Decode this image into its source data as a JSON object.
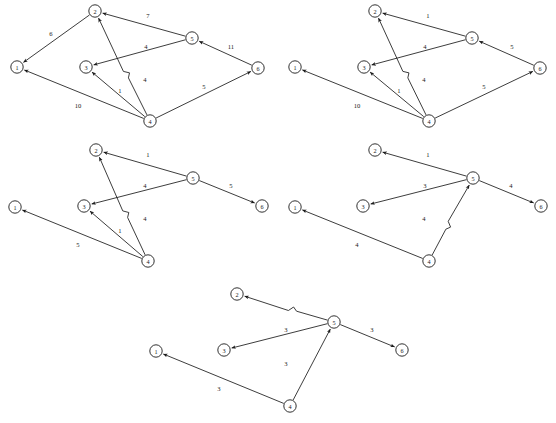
{
  "figure": {
    "title": "",
    "panel_count": 5,
    "node_labels": [
      "1",
      "2",
      "3",
      "4",
      "5",
      "6"
    ],
    "panels": [
      {
        "name": "panel-1",
        "origin": {
          "x": 0,
          "y": 0
        },
        "nodes": [
          {
            "id": "1",
            "label": "1",
            "x": 17,
            "y": 67
          },
          {
            "id": "2",
            "label": "2",
            "x": 95,
            "y": 11
          },
          {
            "id": "3",
            "label": "3",
            "x": 86,
            "y": 67
          },
          {
            "id": "4",
            "label": "4",
            "x": 150,
            "y": 121
          },
          {
            "id": "5",
            "label": "5",
            "x": 192,
            "y": 38
          },
          {
            "id": "6",
            "label": "6",
            "x": 258,
            "y": 68
          }
        ],
        "edges": [
          {
            "from": "2",
            "to": "1",
            "weight": "6",
            "label_x": 51,
            "label_y": 33
          },
          {
            "from": "5",
            "to": "2",
            "weight": "7",
            "label_x": 148,
            "label_y": 15
          },
          {
            "from": "5",
            "to": "3",
            "weight": "4",
            "label_x": 146,
            "label_y": 46
          },
          {
            "from": "4",
            "to": "2",
            "weight": "4",
            "label_x": 145,
            "label_y": 79,
            "hop": true
          },
          {
            "from": "4",
            "to": "3",
            "weight": "1",
            "label_x": 120,
            "label_y": 90
          },
          {
            "from": "4",
            "to": "1",
            "weight": "10",
            "label_x": 78,
            "label_y": 105
          },
          {
            "from": "6",
            "to": "5",
            "weight": "11",
            "label_x": 231,
            "label_y": 46
          },
          {
            "from": "4",
            "to": "6",
            "weight": "5",
            "label_x": 204,
            "label_y": 86
          }
        ]
      },
      {
        "name": "panel-2",
        "origin": {
          "x": 278,
          "y": 0
        },
        "nodes": [
          {
            "id": "1",
            "label": "1",
            "x": 295,
            "y": 67
          },
          {
            "id": "2",
            "label": "2",
            "x": 375,
            "y": 11
          },
          {
            "id": "3",
            "label": "3",
            "x": 364,
            "y": 67
          },
          {
            "id": "4",
            "label": "4",
            "x": 429,
            "y": 121
          },
          {
            "id": "5",
            "label": "5",
            "x": 472,
            "y": 38
          },
          {
            "id": "6",
            "label": "6",
            "x": 540,
            "y": 68
          }
        ],
        "edges": [
          {
            "from": "5",
            "to": "2",
            "weight": "1",
            "label_x": 428,
            "label_y": 15
          },
          {
            "from": "5",
            "to": "3",
            "weight": "4",
            "label_x": 425,
            "label_y": 46
          },
          {
            "from": "4",
            "to": "2",
            "weight": "4",
            "label_x": 424,
            "label_y": 79,
            "hop": true
          },
          {
            "from": "4",
            "to": "3",
            "weight": "1",
            "label_x": 399,
            "label_y": 90
          },
          {
            "from": "4",
            "to": "1",
            "weight": "10",
            "label_x": 357,
            "label_y": 105
          },
          {
            "from": "6",
            "to": "5",
            "weight": "5",
            "label_x": 512,
            "label_y": 46
          },
          {
            "from": "4",
            "to": "6",
            "weight": "5",
            "label_x": 484,
            "label_y": 86
          }
        ]
      },
      {
        "name": "panel-3",
        "origin": {
          "x": 0,
          "y": 139
        },
        "nodes": [
          {
            "id": "1",
            "label": "1",
            "x": 15,
            "y": 207
          },
          {
            "id": "2",
            "label": "2",
            "x": 96,
            "y": 150
          },
          {
            "id": "3",
            "label": "3",
            "x": 84,
            "y": 206
          },
          {
            "id": "4",
            "label": "4",
            "x": 148,
            "y": 261
          },
          {
            "id": "5",
            "label": "5",
            "x": 193,
            "y": 178
          },
          {
            "id": "6",
            "label": "6",
            "x": 262,
            "y": 206
          }
        ],
        "edges": [
          {
            "from": "5",
            "to": "2",
            "weight": "1",
            "label_x": 148,
            "label_y": 154
          },
          {
            "from": "5",
            "to": "3",
            "weight": "4",
            "label_x": 145,
            "label_y": 185
          },
          {
            "from": "4",
            "to": "2",
            "weight": "4",
            "label_x": 145,
            "label_y": 218,
            "hop": true
          },
          {
            "from": "4",
            "to": "3",
            "weight": "1",
            "label_x": 120,
            "label_y": 230
          },
          {
            "from": "4",
            "to": "1",
            "weight": "5",
            "label_x": 78,
            "label_y": 244
          },
          {
            "from": "5",
            "to": "6",
            "weight": "5",
            "label_x": 231,
            "label_y": 185
          }
        ]
      },
      {
        "name": "panel-4",
        "origin": {
          "x": 278,
          "y": 139
        },
        "nodes": [
          {
            "id": "1",
            "label": "1",
            "x": 295,
            "y": 207
          },
          {
            "id": "2",
            "label": "2",
            "x": 375,
            "y": 150
          },
          {
            "id": "3",
            "label": "3",
            "x": 363,
            "y": 206
          },
          {
            "id": "4",
            "label": "4",
            "x": 429,
            "y": 261
          },
          {
            "id": "5",
            "label": "5",
            "x": 473,
            "y": 178
          },
          {
            "id": "6",
            "label": "6",
            "x": 541,
            "y": 206
          }
        ],
        "edges": [
          {
            "from": "5",
            "to": "2",
            "weight": "1",
            "label_x": 428,
            "label_y": 154
          },
          {
            "from": "5",
            "to": "3",
            "weight": "3",
            "label_x": 425,
            "label_y": 185
          },
          {
            "from": "4",
            "to": "5",
            "weight": "4",
            "label_x": 424,
            "label_y": 218,
            "hop": true
          },
          {
            "from": "4",
            "to": "1",
            "weight": "4",
            "label_x": 357,
            "label_y": 244
          },
          {
            "from": "5",
            "to": "6",
            "weight": "4",
            "label_x": 511,
            "label_y": 185
          }
        ]
      },
      {
        "name": "panel-5",
        "origin": {
          "x": 140,
          "y": 283
        },
        "nodes": [
          {
            "id": "1",
            "label": "1",
            "x": 156,
            "y": 351
          },
          {
            "id": "2",
            "label": "2",
            "x": 237,
            "y": 294
          },
          {
            "id": "3",
            "label": "3",
            "x": 224,
            "y": 350
          },
          {
            "id": "4",
            "label": "4",
            "x": 290,
            "y": 406
          },
          {
            "id": "5",
            "label": "5",
            "x": 334,
            "y": 322
          },
          {
            "id": "6",
            "label": "6",
            "x": 402,
            "y": 350
          }
        ],
        "edges": [
          {
            "from": "5",
            "to": "2",
            "weight": "",
            "label_x": 0,
            "label_y": 0,
            "hop": true
          },
          {
            "from": "5",
            "to": "3",
            "weight": "3",
            "label_x": 286,
            "label_y": 329
          },
          {
            "from": "4",
            "to": "5",
            "weight": "3",
            "label_x": 286,
            "label_y": 363
          },
          {
            "from": "4",
            "to": "1",
            "weight": "3",
            "label_x": 219,
            "label_y": 388
          },
          {
            "from": "5",
            "to": "6",
            "weight": "3",
            "label_x": 372,
            "label_y": 329
          }
        ]
      }
    ]
  },
  "style": {
    "stroke_color": "#1a1a1a",
    "node_fill": "#ffffff",
    "background": "#ffffff",
    "node_radius": 6.2
  }
}
